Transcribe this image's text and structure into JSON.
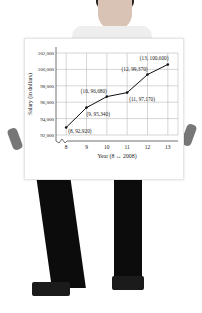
{
  "chart_data": {
    "type": "line",
    "title": "",
    "xlabel": "Year (8 ↔ 2008)",
    "ylabel": "Salary (in dollars)",
    "x": [
      8,
      9,
      10,
      11,
      12,
      13
    ],
    "series": [
      {
        "name": "Salary",
        "values": [
          92920,
          95340,
          96680,
          97170,
          99370,
          100600
        ]
      }
    ],
    "point_labels": [
      "(8, 92,920)",
      "(9, 95,340)",
      "(10, 96,680)",
      "(11, 97,170)",
      "(12, 99,370)",
      "(13, 100,600)"
    ],
    "xticks": [
      "8",
      "9",
      "10",
      "11",
      "12",
      "13"
    ],
    "yticks": [
      "92,000",
      "94,000",
      "96,000",
      "98,000",
      "100,000",
      "102,000"
    ],
    "xlim": [
      7.5,
      13.5
    ],
    "ylim": [
      92000,
      102000
    ],
    "grid": true,
    "legend": "none",
    "axis_break": true
  },
  "colors": {
    "line": "#111111",
    "grid": "#bbbbbb",
    "text": "#222222"
  }
}
